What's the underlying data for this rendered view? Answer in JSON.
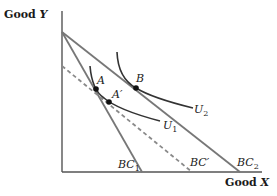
{
  "axes": {
    "y_label_prefix": "Good ",
    "y_label_var": "Y",
    "x_label_prefix": "Good ",
    "x_label_var": "X"
  },
  "budget_constraints": [
    {
      "id": "BC1",
      "label_main": "BC",
      "label_sub": "1",
      "style": "solid"
    },
    {
      "id": "BC_prime",
      "label_main": "BC′",
      "label_sub": "",
      "style": "dashed"
    },
    {
      "id": "BC2",
      "label_main": "BC",
      "label_sub": "2",
      "style": "solid"
    }
  ],
  "indifference_curves": [
    {
      "id": "U1",
      "label_main": "U",
      "label_sub": "1"
    },
    {
      "id": "U2",
      "label_main": "U",
      "label_sub": "2"
    }
  ],
  "points": [
    {
      "id": "A",
      "label": "A"
    },
    {
      "id": "A_prime",
      "label": "A′"
    },
    {
      "id": "B",
      "label": "B"
    }
  ],
  "colors": {
    "axis": "#555555",
    "budget_line": "#777777",
    "dashed_line": "#8a8a8a",
    "indifference_curve": "#333333",
    "point": "#111111"
  }
}
